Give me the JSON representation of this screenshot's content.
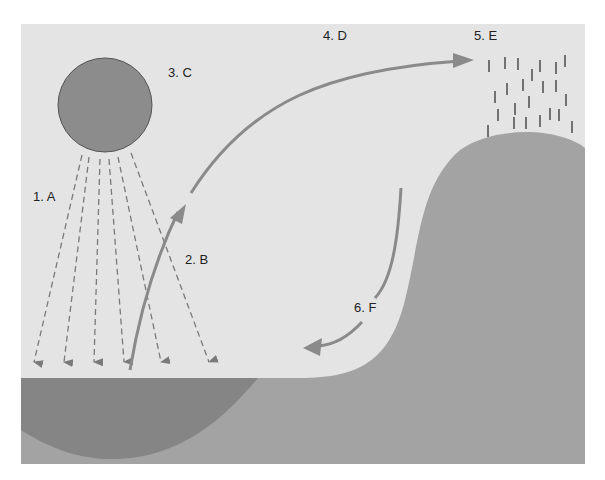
{
  "diagram": {
    "colors": {
      "page": "#ffffff",
      "sky": "#e4e4e4",
      "sun": "#8c8c8c",
      "sun_stroke": "#555555",
      "ground": "#a3a3a3",
      "water": "#858585",
      "arrow": "#8a8a8a",
      "dashed_arrow": "#7a7a7a",
      "rain": "#555555",
      "text": "#222222"
    },
    "labels": [
      {
        "id": "A",
        "text": "1.  A",
        "x": 33,
        "y": 201
      },
      {
        "id": "B",
        "text": "2.  B",
        "x": 185,
        "y": 264
      },
      {
        "id": "C",
        "text": "3.  C",
        "x": 168,
        "y": 77
      },
      {
        "id": "D",
        "text": "4.  D",
        "x": 323,
        "y": 40
      },
      {
        "id": "E",
        "text": "5.  E",
        "x": 474,
        "y": 40
      },
      {
        "id": "F",
        "text": "6.  F",
        "x": 354,
        "y": 312
      }
    ],
    "elements": [
      {
        "name": "sun",
        "label_ref": "C"
      },
      {
        "name": "solar-rays",
        "label_ref": "A",
        "count": 6
      },
      {
        "name": "evaporation-arrow",
        "label_ref": "B"
      },
      {
        "name": "condensation-arrow",
        "label_ref": "D"
      },
      {
        "name": "precipitation",
        "label_ref": "E"
      },
      {
        "name": "runoff-arrow",
        "label_ref": "F"
      },
      {
        "name": "water-body"
      },
      {
        "name": "land-hill"
      }
    ]
  }
}
